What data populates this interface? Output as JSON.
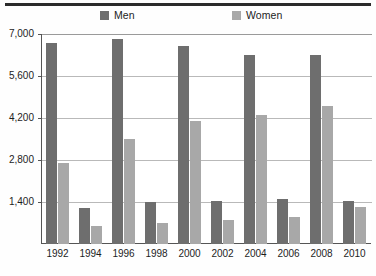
{
  "legend": {
    "items": [
      {
        "label": "Men",
        "color": "#6e6e6e",
        "icon": "legend-swatch-icon"
      },
      {
        "label": "Women",
        "color": "#a8a8a8",
        "icon": "legend-swatch-icon"
      }
    ]
  },
  "axis": {
    "y_ticks": [
      "7,000",
      "5,600",
      "4,200",
      "2,800",
      "1,400"
    ],
    "y_tick_values": [
      7000,
      5600,
      4200,
      2800,
      1400
    ],
    "x_ticks": [
      "1992",
      "1994",
      "1996",
      "1998",
      "2000",
      "2002",
      "2004",
      "2006",
      "2008",
      "2010"
    ]
  },
  "chart_data": {
    "type": "bar",
    "title": "",
    "subtitle": "",
    "xlabel": "",
    "ylabel": "",
    "categories": [
      "1992",
      "1994",
      "1996",
      "1998",
      "2000",
      "2002",
      "2004",
      "2006",
      "2008",
      "2010"
    ],
    "series": [
      {
        "name": "Men",
        "color": "#6e6e6e",
        "values": [
          6700,
          1200,
          6850,
          1400,
          6600,
          1450,
          6300,
          1500,
          6300,
          1450
        ]
      },
      {
        "name": "Women",
        "color": "#a8a8a8",
        "values": [
          2700,
          600,
          3500,
          700,
          4100,
          800,
          4300,
          900,
          4600,
          1250
        ]
      }
    ],
    "ylim": [
      0,
      7000
    ],
    "yticks": [
      1400,
      2800,
      4200,
      5600,
      7000
    ],
    "grid": true,
    "legend_position": "top"
  },
  "colors": {
    "men": "#6e6e6e",
    "women": "#a8a8a8",
    "grid": "#b9b9b9",
    "axis": "#555555",
    "rule": "#2b2b2b",
    "background": "#ffffff",
    "text": "#1d1d1d"
  }
}
